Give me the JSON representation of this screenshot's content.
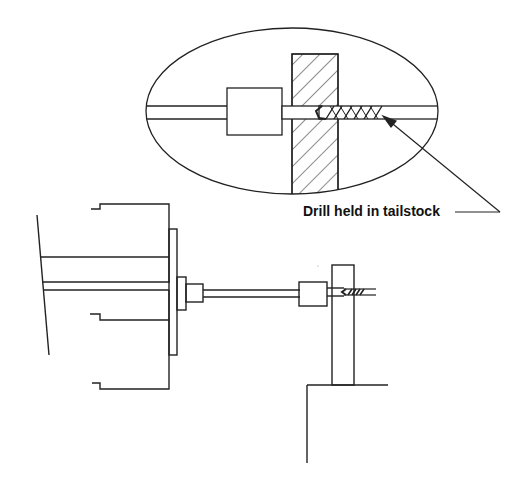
{
  "diagram": {
    "annotation": {
      "label": "Drill held in tailstock",
      "points_to": "drill-bit-detail"
    },
    "components": [
      {
        "id": "headstock",
        "description": "Headstock with spindle"
      },
      {
        "id": "chuck-faceplate",
        "description": "Chuck / faceplate"
      },
      {
        "id": "spindle-shaft",
        "description": "Long shaft"
      },
      {
        "id": "collet-block",
        "description": "Block holding workpiece"
      },
      {
        "id": "workpiece",
        "description": "Hatched workpiece being drilled"
      },
      {
        "id": "drill-bit",
        "description": "Twist drill held in tailstock"
      },
      {
        "id": "support-stand",
        "description": "Vertical support and base"
      }
    ],
    "detail_view": {
      "shape": "ellipse",
      "description": "Magnified view of drill entering workpiece"
    },
    "colors": {
      "line": "#222222",
      "background": "#ffffff"
    }
  }
}
